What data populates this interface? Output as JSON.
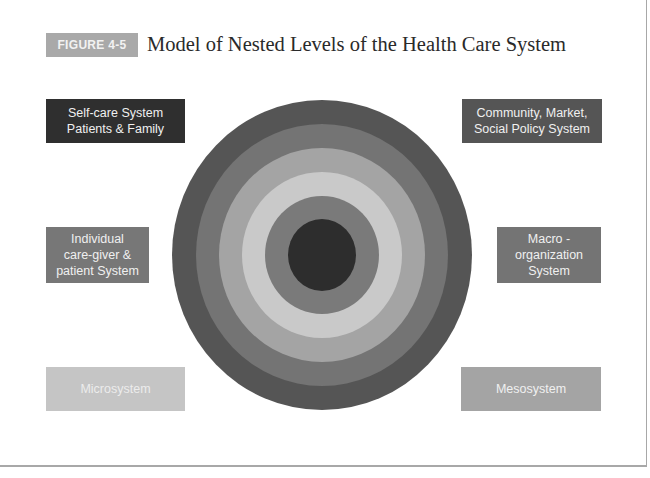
{
  "figure": {
    "label": "FIGURE 4-5",
    "title": "Model of Nested Levels of the Health Care System",
    "label_color": "#a9a9a9"
  },
  "levels": [
    {
      "id": "self-care",
      "label": "Self-care System\nPatients & Family",
      "color": "#2f2f2f",
      "text_color": "#f0f0f0"
    },
    {
      "id": "individual",
      "label": "Individual\ncare-giver &\npatient System",
      "color": "#777777",
      "text_color": "#f0f0f0"
    },
    {
      "id": "microsystem",
      "label": "Microsystem",
      "color": "#c5c5c5",
      "text_color": "#ececec"
    },
    {
      "id": "mesosystem",
      "label": "Mesosystem",
      "color": "#a4a4a4",
      "text_color": "#f0f0f0"
    },
    {
      "id": "macro",
      "label": "Macro -\norganization\nSystem",
      "color": "#747474",
      "text_color": "#f0f0f0"
    },
    {
      "id": "community",
      "label": "Community, Market,\nSocial Policy System",
      "color": "#555555",
      "text_color": "#f0f0f0"
    }
  ],
  "rings": {
    "center_x": 322,
    "center_y": 255,
    "outer_to_inner": [
      {
        "level": "community",
        "rx": 150,
        "ry": 155,
        "color": "#555555"
      },
      {
        "level": "macro",
        "rx": 126,
        "ry": 131,
        "color": "#747474"
      },
      {
        "level": "mesosystem",
        "rx": 103,
        "ry": 107,
        "color": "#a4a4a4"
      },
      {
        "level": "microsystem",
        "rx": 80,
        "ry": 83,
        "color": "#c9c9c9"
      },
      {
        "level": "individual",
        "rx": 57,
        "ry": 59,
        "color": "#7a7a7a"
      },
      {
        "level": "self-care",
        "rx": 34,
        "ry": 36,
        "color": "#2d2d2d"
      }
    ]
  }
}
